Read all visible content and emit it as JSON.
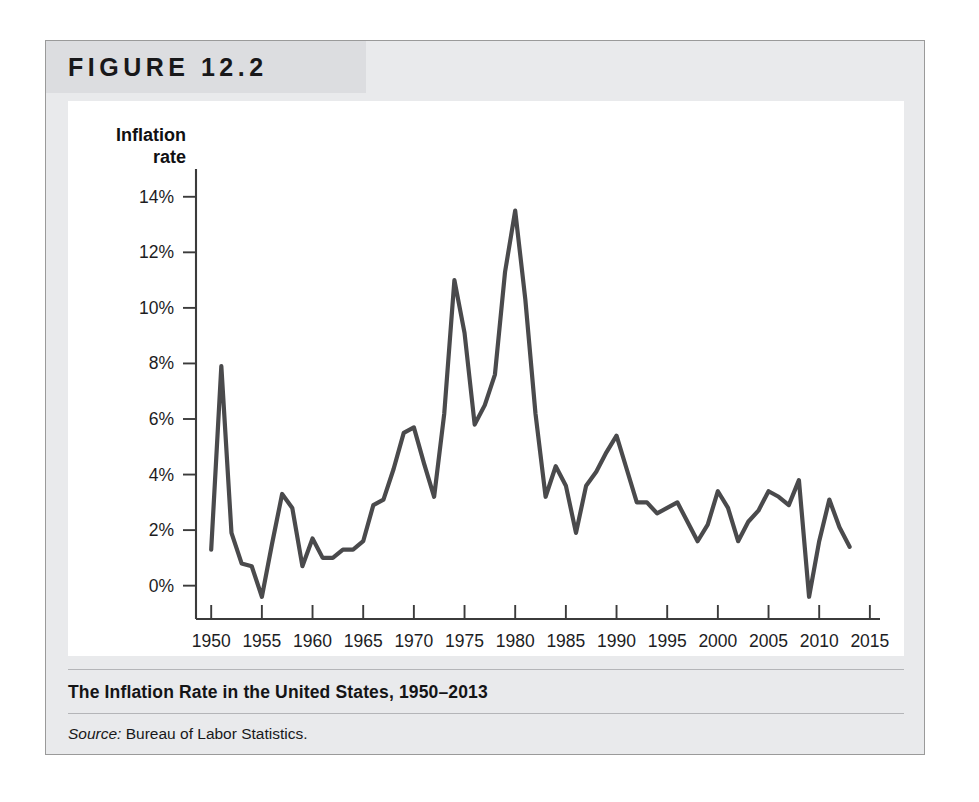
{
  "figure": {
    "number_label": "FIGURE 12.2",
    "caption": "The Inflation Rate in the United States, 1950–2013",
    "source_label": "Source:",
    "source_text": "Bureau of Labor Statistics."
  },
  "chart_data": {
    "type": "line",
    "title": "The Inflation Rate in the United States, 1950–2013",
    "xlabel": "Year",
    "ylabel": "Inflation rate",
    "ylabel_line1": "Inflation",
    "ylabel_line2": "rate",
    "xlim": [
      1948.5,
      2016
    ],
    "ylim": [
      -1.2,
      15.0
    ],
    "grid": false,
    "legend": false,
    "line_color": "#4a4a4c",
    "axis_color": "#3b3b3b",
    "plot_background": "#ffffff",
    "ytick_labels": [
      "14%",
      "12%",
      "10%",
      "8%",
      "6%",
      "4%",
      "2%",
      "0%"
    ],
    "ytick_values": [
      14,
      12,
      10,
      8,
      6,
      4,
      2,
      0
    ],
    "xtick_labels": [
      "1950",
      "1955",
      "1960",
      "1965",
      "1970",
      "1975",
      "1980",
      "1985",
      "1990",
      "1995",
      "2000",
      "2005",
      "2010",
      "2015"
    ],
    "xtick_values": [
      1950,
      1955,
      1960,
      1965,
      1970,
      1975,
      1980,
      1985,
      1990,
      1995,
      2000,
      2005,
      2010,
      2015
    ],
    "series_name": "US inflation rate",
    "x": [
      1950,
      1951,
      1952,
      1953,
      1954,
      1955,
      1956,
      1957,
      1958,
      1959,
      1960,
      1961,
      1962,
      1963,
      1964,
      1965,
      1966,
      1967,
      1968,
      1969,
      1970,
      1971,
      1972,
      1973,
      1974,
      1975,
      1976,
      1977,
      1978,
      1979,
      1980,
      1981,
      1982,
      1983,
      1984,
      1985,
      1986,
      1987,
      1988,
      1989,
      1990,
      1991,
      1992,
      1993,
      1994,
      1995,
      1996,
      1997,
      1998,
      1999,
      2000,
      2001,
      2002,
      2003,
      2004,
      2005,
      2006,
      2007,
      2008,
      2009,
      2010,
      2011,
      2012,
      2013
    ],
    "values": [
      1.3,
      7.9,
      1.9,
      0.8,
      0.7,
      -0.4,
      1.5,
      3.3,
      2.8,
      0.7,
      1.7,
      1.0,
      1.0,
      1.3,
      1.3,
      1.6,
      2.9,
      3.1,
      4.2,
      5.5,
      5.7,
      4.4,
      3.2,
      6.2,
      11.0,
      9.1,
      5.8,
      6.5,
      7.6,
      11.3,
      13.5,
      10.3,
      6.2,
      3.2,
      4.3,
      3.6,
      1.9,
      3.6,
      4.1,
      4.8,
      5.4,
      4.2,
      3.0,
      3.0,
      2.6,
      2.8,
      3.0,
      2.3,
      1.6,
      2.2,
      3.4,
      2.8,
      1.6,
      2.3,
      2.7,
      3.4,
      3.2,
      2.9,
      3.8,
      -0.4,
      1.6,
      3.1,
      2.1,
      1.4
    ]
  }
}
